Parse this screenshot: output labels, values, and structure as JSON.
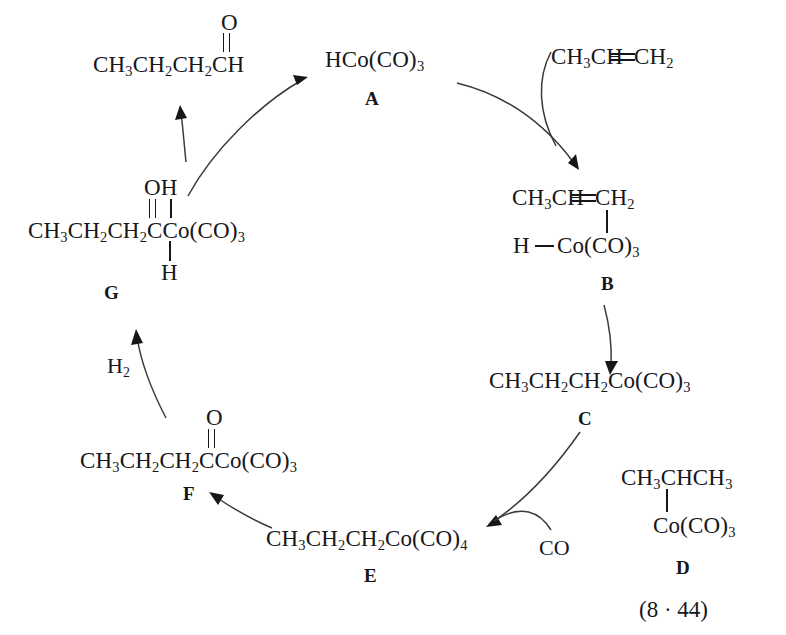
{
  "figure": {
    "equation_number": "(8 · 44)"
  },
  "species": {
    "aldehyde": {
      "name": "butanal-product",
      "chain": "CH3CH2CH2CH",
      "chain_html": "CH<sub>3</sub>CH<sub>2</sub>CH<sub>2</sub>CH",
      "carbonyl_o": "O"
    },
    "A": {
      "label": "A",
      "formula": "HCo(CO)3",
      "formula_html": "HCo<span class=\"paren\">(</span>CO<span class=\"paren\">)</span><sub>3</sub>"
    },
    "propene": {
      "name": "propene-reagent",
      "formula": "CH3CH=CH2",
      "left_html": "CH<sub>3</sub>CH",
      "right_html": "CH<sub>2</sub>"
    },
    "B": {
      "label": "B",
      "top_left_html": "CH<sub>3</sub>CH",
      "top_right_html": "CH<sub>2</sub>",
      "bottom_h": "H",
      "bottom_co_html": "Co<span class=\"paren\">(</span>CO<span class=\"paren\">)</span><sub>3</sub>"
    },
    "C": {
      "label": "C",
      "formula": "CH3CH2CH2Co(CO)3",
      "formula_html": "CH<sub>3</sub>CH<sub>2</sub>CH<sub>2</sub>Co<span class=\"paren\">(</span>CO<span class=\"paren\">)</span><sub>3</sub>"
    },
    "D": {
      "label": "D",
      "top_html": "CH<sub>3</sub>CHCH<sub>3</sub>",
      "bottom_html": "Co<span class=\"paren\">(</span>CO<span class=\"paren\">)</span><sub>3</sub>"
    },
    "E": {
      "label": "E",
      "formula": "CH3CH2CH2Co(CO)4",
      "formula_html": "CH<sub>3</sub>CH<sub>2</sub>CH<sub>2</sub>Co<span class=\"paren\">(</span>CO<span class=\"paren\">)</span><sub>4</sub>"
    },
    "F": {
      "label": "F",
      "chain_html": "CH<sub>3</sub>CH<sub>2</sub>CH<sub>2</sub>CCo<span class=\"paren\">(</span>CO<span class=\"paren\">)</span><sub>3</sub>",
      "carbonyl_o": "O"
    },
    "G": {
      "label": "G",
      "chain_html": "CH<sub>3</sub>CH<sub>2</sub>CH<sub>2</sub>CCo<span class=\"paren\">(</span>CO<span class=\"paren\">)</span><sub>3</sub>",
      "top_oh": "OH",
      "bottom_h": "H"
    }
  },
  "reagents": {
    "co": "CO",
    "h2": "H2",
    "h2_html": "H<sub>2</sub>"
  },
  "colors": {
    "ink": "#17171b",
    "arrow": "#3a3a40",
    "background": "#ffffff"
  }
}
